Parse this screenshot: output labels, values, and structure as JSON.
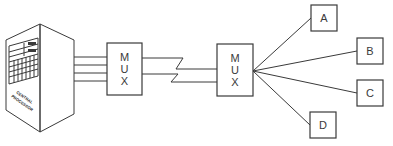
{
  "diagram": {
    "type": "network-multiplexing",
    "computer": {
      "label_line1": "CENTRAL",
      "label_line2": "PROCESSOR"
    },
    "mux_left": {
      "letters": [
        "M",
        "U",
        "X"
      ]
    },
    "mux_right": {
      "letters": [
        "M",
        "U",
        "X"
      ]
    },
    "link": "zigzag communication line (2 channels)",
    "terminals": [
      {
        "id": "A",
        "label": "A"
      },
      {
        "id": "B",
        "label": "B"
      },
      {
        "id": "C",
        "label": "C"
      },
      {
        "id": "D",
        "label": "D"
      }
    ]
  }
}
